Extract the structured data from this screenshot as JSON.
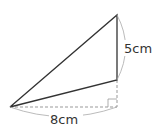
{
  "diagram": {
    "type": "geometry-triangle",
    "labels": {
      "vertical_side": "5cm",
      "horizontal_base": "8cm"
    },
    "points": {
      "left": [
        10,
        107
      ],
      "top": [
        117,
        15
      ],
      "mid_right": [
        117,
        80
      ],
      "foot": [
        117,
        107
      ]
    },
    "colors": {
      "stroke": "#333333",
      "dashed": "#999999",
      "arc": "#aaaaaa"
    }
  }
}
